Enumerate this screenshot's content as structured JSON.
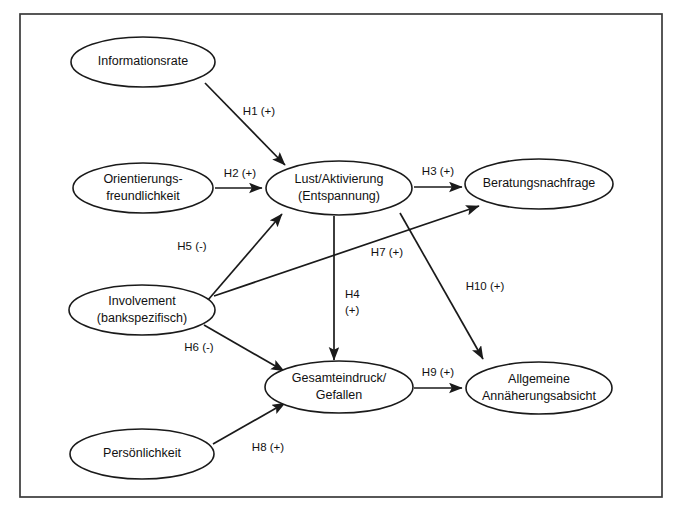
{
  "figure": {
    "kind": "path-diagram",
    "title_visible": false,
    "background_color": "#ffffff",
    "line_color": "#1a1a1a",
    "frame": {
      "x": 20,
      "y": 14,
      "width": 642,
      "height": 483
    }
  },
  "nodes": [
    {
      "id": "informationsrate",
      "label_lines": [
        "Informationsrate"
      ],
      "line1": "Informationsrate",
      "line2": "",
      "cx": 143,
      "cy": 62,
      "rx": 72,
      "ry": 25
    },
    {
      "id": "orientierungsfreundlichkeit",
      "label_lines": [
        "Orientierungs-",
        "freundlichkeit"
      ],
      "line1": "Orientierungs-",
      "line2": "freundlichkeit",
      "cx": 143,
      "cy": 188,
      "rx": 70,
      "ry": 25
    },
    {
      "id": "lust-aktivierung",
      "label_lines": [
        "Lust/Aktivierung",
        "(Entspannung)"
      ],
      "line1": "Lust/Aktivierung",
      "line2": "(Entspannung)",
      "cx": 339,
      "cy": 188,
      "rx": 73,
      "ry": 27
    },
    {
      "id": "beratungsnachfrage",
      "label_lines": [
        "Beratungsnachfrage"
      ],
      "line1": "Beratungsnachfrage",
      "line2": "",
      "cx": 539,
      "cy": 184,
      "rx": 74,
      "ry": 25
    },
    {
      "id": "involvement",
      "label_lines": [
        "Involvement",
        "(bankspezifisch)"
      ],
      "line1": "Involvement",
      "line2": "(bankspezifisch)",
      "cx": 142,
      "cy": 310,
      "rx": 73,
      "ry": 25
    },
    {
      "id": "gesamteindruck-gefallen",
      "label_lines": [
        "Gesamteindruck/",
        "Gefallen"
      ],
      "line1": "Gesamteindruck/",
      "line2": "Gefallen",
      "cx": 339,
      "cy": 387,
      "rx": 74,
      "ry": 26
    },
    {
      "id": "allgemeine-annaeherungsabsicht",
      "label_lines": [
        "Allgemeine",
        "Annäherungsabsicht"
      ],
      "line1": "Allgemeine",
      "line2": "Annäherungsabsicht",
      "cx": 539,
      "cy": 388,
      "rx": 73,
      "ry": 26
    },
    {
      "id": "persoenlichkeit",
      "label_lines": [
        "Persönlichkeit"
      ],
      "line1": "Persönlichkeit",
      "line2": "",
      "cx": 142,
      "cy": 454,
      "rx": 72,
      "ry": 25
    }
  ],
  "edges": [
    {
      "id": "h1",
      "label": "H1 (+)",
      "sign": "+",
      "from": "informationsrate",
      "to": "lust-aktivierung",
      "path": "M 205,83 L 285,165",
      "label_x": 259,
      "label_y": 112
    },
    {
      "id": "h2",
      "label": "H2 (+)",
      "sign": "+",
      "from": "orientierungsfreundlichkeit",
      "to": "lust-aktivierung",
      "path": "M 215,188 L 262,188",
      "label_x": 240,
      "label_y": 174
    },
    {
      "id": "h3",
      "label": "H3 (+)",
      "sign": "+",
      "from": "lust-aktivierung",
      "to": "beratungsnachfrage",
      "path": "M 414,187 L 462,187",
      "label_x": 438,
      "label_y": 172
    },
    {
      "id": "h4",
      "label": "H4",
      "label2": "(+)",
      "sign": "+",
      "from": "lust-aktivierung",
      "to": "gesamteindruck-gefallen",
      "path": "M 334,216 L 334,360",
      "label_x": 345,
      "label_y": 295
    },
    {
      "id": "h5",
      "label": "H5 (-)",
      "sign": "-",
      "from": "involvement",
      "to": "lust-aktivierung",
      "path": "M 208,300 L 282,214",
      "label_x": 192,
      "label_y": 247
    },
    {
      "id": "h6",
      "label": "H6 (-)",
      "sign": "-",
      "from": "involvement",
      "to": "gesamteindruck-gefallen",
      "path": "M 204,325 L 284,371",
      "label_x": 199,
      "label_y": 348
    },
    {
      "id": "h7",
      "label": "H7 (+)",
      "sign": "+",
      "from": "involvement",
      "to": "beratungsnachfrage",
      "path": "M 214,296 L 479,206",
      "label_x": 387,
      "label_y": 253
    },
    {
      "id": "h8",
      "label": "H8 (+)",
      "sign": "+",
      "from": "persoenlichkeit",
      "to": "gesamteindruck-gefallen",
      "path": "M 213,444 L 285,403",
      "label_x": 268,
      "label_y": 448
    },
    {
      "id": "h9",
      "label": "H9 (+)",
      "sign": "+",
      "from": "gesamteindruck-gefallen",
      "to": "allgemeine-annaeherungsabsicht",
      "path": "M 414,388 L 462,388",
      "label_x": 438,
      "label_y": 373
    },
    {
      "id": "h10",
      "label": "H10 (+)",
      "sign": "+",
      "from": "lust-aktivierung",
      "to": "allgemeine-annaeherungsabsicht",
      "path": "M 400,213 L 483,359",
      "label_x": 485,
      "label_y": 287
    }
  ]
}
